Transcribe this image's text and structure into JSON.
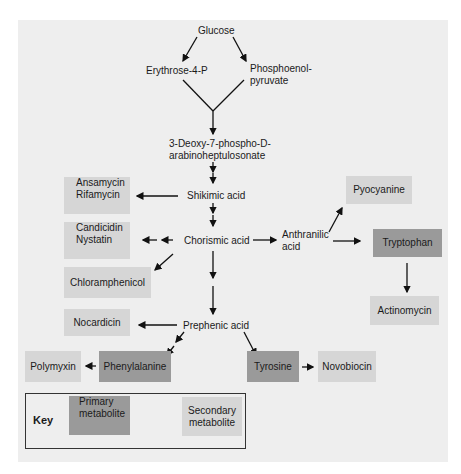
{
  "diagram": {
    "title": "",
    "nodes": {
      "glucose": "Glucose",
      "erythrose": "Erythrose-4-P",
      "pep_line1": "Phosphoenol-",
      "pep_line2": "pyruvate",
      "dahp_line1": "3-Deoxy-7-phospho-D-",
      "dahp_line2": "arabinoheptulosonate",
      "shikimic": "Shikimic acid",
      "chorismic": "Chorismic acid",
      "anthranilic_line1": "Anthranilic",
      "anthranilic_line2": "acid",
      "prephenic": "Prephenic acid",
      "ansamycin_line1": "Ansamycin",
      "ansamycin_line2": "Rifamycin",
      "candicidin_line1": "Candicidin",
      "candicidin_line2": "Nystatin",
      "chloramphenicol": "Chloramphenicol",
      "nocardicin": "Nocardicin",
      "pyocyanine": "Pyocyanine",
      "tryptophan": "Tryptophan",
      "actinomycin": "Actinomycin",
      "polymyxin": "Polymyxin",
      "phenylalanine": "Phenylalanine",
      "tyrosine": "Tyrosine",
      "novobiocin": "Novobiocin"
    },
    "colors": {
      "panel": "#eeeeee",
      "primary_metabolite": "#9a9a9a",
      "secondary_metabolite": "#d6d6d6"
    }
  },
  "key": {
    "title": "Key",
    "primary_line1": "Primary",
    "primary_line2": "metabolite",
    "secondary_line1": "Secondary",
    "secondary_line2": "metabolite"
  }
}
